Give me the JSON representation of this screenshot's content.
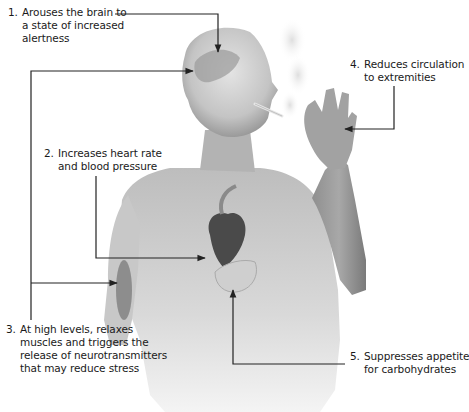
{
  "diagram": {
    "colors": {
      "background": "#ffffff",
      "text": "#1a1a1a",
      "connector": "#222222",
      "skin_light": "#dcdcdc",
      "skin_mid": "#a9a9a9",
      "skin_dark": "#6b6b6b",
      "organ": "#4a4a4a"
    },
    "callouts": [
      {
        "number": "1.",
        "lines": [
          "Arouses the brain to",
          "a state of increased",
          "alertness"
        ],
        "target": "brain"
      },
      {
        "number": "2.",
        "lines": [
          "Increases heart rate",
          "and blood pressure"
        ],
        "target": "heart"
      },
      {
        "number": "3.",
        "lines": [
          "At high levels, relaxes",
          "muscles and triggers the",
          "release of neurotransmitters",
          "that may reduce stress"
        ],
        "target": "brain and arm muscle"
      },
      {
        "number": "4.",
        "lines": [
          "Reduces circulation",
          "to extremities"
        ],
        "target": "hand"
      },
      {
        "number": "5.",
        "lines": [
          "Suppresses appetite",
          "for carbohydrates"
        ],
        "target": "stomach"
      }
    ]
  }
}
